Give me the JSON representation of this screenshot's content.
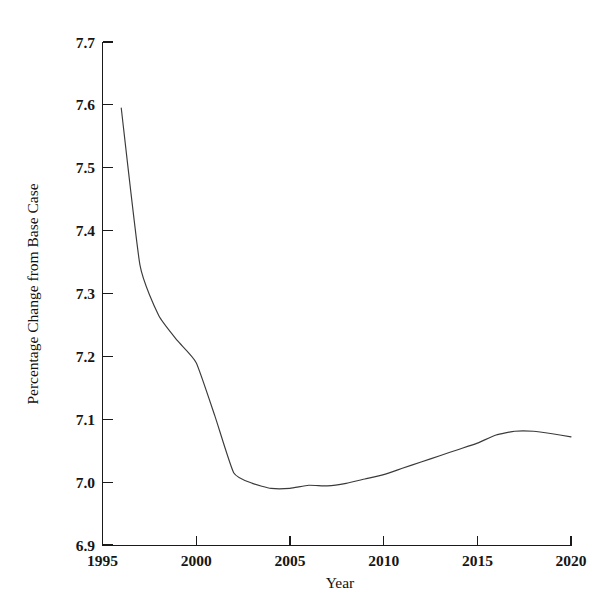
{
  "chart_data": {
    "type": "line",
    "title": "",
    "xlabel": "Year",
    "ylabel": "Percentage Change from Base Case",
    "xlim": [
      1995,
      2020
    ],
    "ylim": [
      6.9,
      7.7
    ],
    "grid": false,
    "legend": "none",
    "xticks": [
      1995,
      2000,
      2005,
      2010,
      2015,
      2020
    ],
    "xtick_labels": [
      "1995",
      "2000",
      "2005",
      "2010",
      "2015",
      "2020"
    ],
    "yticks": [
      6.9,
      7.0,
      7.1,
      7.2,
      7.3,
      7.4,
      7.5,
      7.6,
      7.7
    ],
    "ytick_labels": [
      "6.9",
      "7.0",
      "7.1",
      "7.2",
      "7.3",
      "7.4",
      "7.5",
      "7.6",
      "7.7"
    ],
    "series": [
      {
        "name": "Percentage change from base case",
        "color": "#3a3a3a",
        "x": [
          1996,
          1997,
          1998,
          1999,
          2000,
          2001,
          2002,
          2003,
          2004,
          2005,
          2006,
          2007,
          2008,
          2009,
          2010,
          2011,
          2012,
          2013,
          2014,
          2015,
          2016,
          2017,
          2018,
          2019,
          2020
        ],
        "y": [
          7.595,
          7.345,
          7.265,
          7.225,
          7.19,
          7.105,
          7.015,
          6.998,
          6.99,
          6.99,
          6.995,
          6.994,
          6.998,
          7.005,
          7.012,
          7.022,
          7.032,
          7.042,
          7.052,
          7.062,
          7.075,
          7.081,
          7.081,
          7.077,
          7.072
        ]
      }
    ]
  },
  "figure": {
    "axis_title_x": "Year",
    "axis_title_y": "Percentage Change from Base Case"
  }
}
